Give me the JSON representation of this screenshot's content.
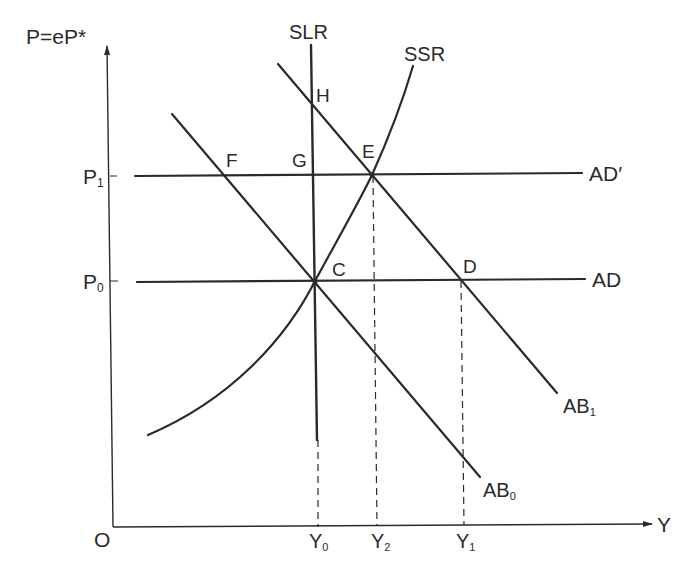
{
  "diagram": {
    "type": "economic-supply-demand-diagram",
    "axes": {
      "y_label": "P=eP*",
      "x_label": "Y",
      "origin_label": "O",
      "y_ticks": [
        {
          "label": "P",
          "sub": "1",
          "y": 176
        },
        {
          "label": "P",
          "sub": "0",
          "y": 281
        }
      ],
      "x_ticks": [
        {
          "label": "Y",
          "sub": "0",
          "x": 316
        },
        {
          "label": "Y",
          "sub": "2",
          "x": 373
        },
        {
          "label": "Y",
          "sub": "1",
          "x": 462
        }
      ]
    },
    "curves": {
      "slr": {
        "label": "SLR"
      },
      "ssr": {
        "label": "SSR"
      },
      "ad_prime": {
        "label": "AD′"
      },
      "ad": {
        "label": "AD"
      },
      "ab0": {
        "label": "AB",
        "sub": "0"
      },
      "ab1": {
        "label": "AB",
        "sub": "1"
      }
    },
    "points": {
      "C": {
        "label": "C",
        "x": 315,
        "y": 281
      },
      "D": {
        "label": "D",
        "x": 461,
        "y": 280
      },
      "E": {
        "label": "E",
        "x": 372,
        "y": 175
      },
      "F": {
        "label": "F",
        "x": 226,
        "y": 176
      },
      "G": {
        "label": "G",
        "x": 312,
        "y": 176
      },
      "H": {
        "label": "H",
        "x": 312,
        "y": 102
      }
    },
    "colors": {
      "ink": "#2a2a2a",
      "background": "#ffffff"
    }
  }
}
